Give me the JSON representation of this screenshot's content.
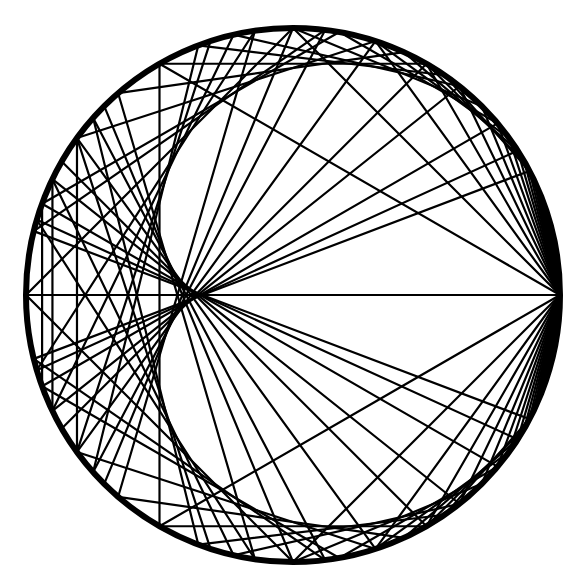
{
  "diagram": {
    "title": "Chord diagram on a circle (points at rational turns p/q)",
    "background": "#ffffff",
    "stroke_color": "#000000",
    "circle": {
      "cx": 293,
      "cy": 295,
      "r": 267,
      "stroke_width": 6
    },
    "chord_stroke_width": 2.2,
    "fan": {
      "from_turn": 0,
      "to_turns": "1/n and (n-1)/n",
      "n_min": 2,
      "n_max": 26
    },
    "mirror_chords": [
      {
        "a": "1/3",
        "b": "2/3"
      },
      {
        "a": "2/5",
        "b": "3/5"
      },
      {
        "a": "3/7",
        "b": "4/7"
      },
      {
        "a": "4/9",
        "b": "5/9"
      }
    ],
    "doubling_chords": {
      "rule": "p/q -> 2p/q mod 1",
      "max_denominator": 13,
      "odd_denominators_only": false
    },
    "extra_chords": [
      {
        "a": "1/6",
        "b": "1/3"
      },
      {
        "a": "5/6",
        "b": "2/3"
      }
    ]
  }
}
